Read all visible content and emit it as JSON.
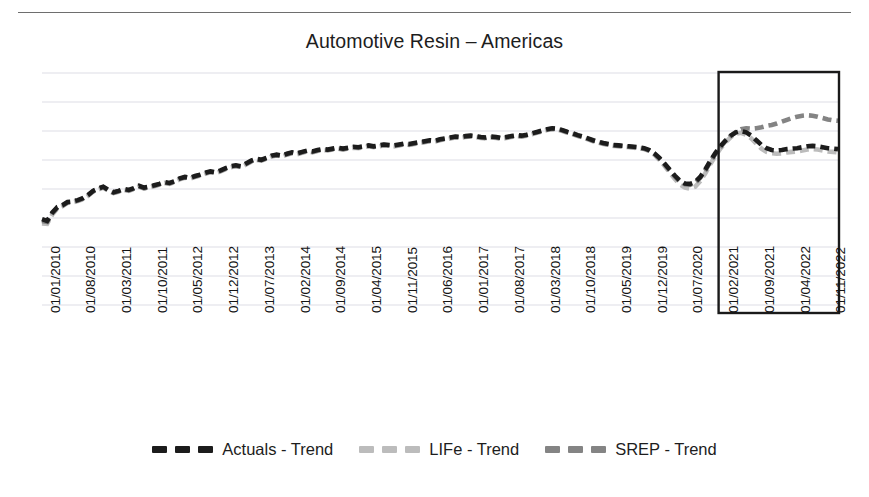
{
  "chart_data": {
    "type": "line",
    "title": "Automotive Resin – Americas",
    "xlabel": "",
    "ylabel": "",
    "grid": true,
    "gridlines": 9,
    "legend_position": "bottom",
    "ylim": [
      0,
      10
    ],
    "colors": {
      "actuals": "#1c1c1c",
      "life": "#bcbcbc",
      "srep": "#848484",
      "gridline": "#d9d9e2",
      "forecast_box": "#1a1a1a"
    },
    "annotations": [
      {
        "name": "forecast-region-box",
        "label": "",
        "start_x": "01/2021",
        "end_x": "01/2023",
        "description": "Rectangle outlining the forecast horizon"
      }
    ],
    "x_tick_labels": [
      "01/01/2010",
      "01/08/2010",
      "01/03/2011",
      "01/10/2011",
      "01/05/2012",
      "01/12/2012",
      "01/07/2013",
      "01/02/2014",
      "01/09/2014",
      "01/04/2015",
      "01/11/2015",
      "01/06/2016",
      "01/01/2017",
      "01/08/2017",
      "01/03/2018",
      "01/10/2018",
      "01/05/2019",
      "01/12/2019",
      "01/07/2020",
      "01/02/2021",
      "01/09/2021",
      "01/04/2022",
      "01/11/2022"
    ],
    "x_tick_indices": [
      0,
      7,
      14,
      21,
      28,
      35,
      42,
      49,
      56,
      63,
      70,
      77,
      84,
      91,
      98,
      105,
      112,
      119,
      126,
      133,
      140,
      147,
      154
    ],
    "n_points": 157,
    "forecast_start_index": 133,
    "series": [
      {
        "name": "Actuals - Trend",
        "key": "actuals",
        "color": "#1c1c1c",
        "dash": "9,5",
        "width": 4.6,
        "values": [
          3.7,
          3.62,
          3.98,
          4.22,
          4.3,
          4.44,
          4.46,
          4.52,
          4.6,
          4.74,
          4.92,
          5.02,
          5.1,
          4.96,
          4.86,
          4.92,
          5.0,
          4.96,
          5.04,
          5.14,
          5.06,
          5.1,
          5.16,
          5.22,
          5.3,
          5.26,
          5.34,
          5.46,
          5.52,
          5.48,
          5.56,
          5.62,
          5.7,
          5.76,
          5.72,
          5.8,
          5.9,
          5.98,
          6.02,
          5.98,
          6.1,
          6.22,
          6.3,
          6.26,
          6.34,
          6.44,
          6.48,
          6.44,
          6.52,
          6.58,
          6.54,
          6.6,
          6.66,
          6.62,
          6.68,
          6.72,
          6.7,
          6.74,
          6.78,
          6.74,
          6.78,
          6.82,
          6.8,
          6.84,
          6.88,
          6.84,
          6.88,
          6.92,
          6.9,
          6.88,
          6.92,
          6.96,
          6.94,
          6.98,
          7.02,
          7.06,
          7.1,
          7.08,
          7.14,
          7.18,
          7.22,
          7.26,
          7.24,
          7.28,
          7.3,
          7.28,
          7.24,
          7.22,
          7.26,
          7.24,
          7.2,
          7.24,
          7.28,
          7.32,
          7.3,
          7.34,
          7.4,
          7.46,
          7.52,
          7.58,
          7.62,
          7.6,
          7.54,
          7.46,
          7.4,
          7.32,
          7.26,
          7.18,
          7.1,
          7.04,
          6.98,
          6.94,
          6.9,
          6.88,
          6.86,
          6.84,
          6.82,
          6.8,
          6.76,
          6.68,
          6.54,
          6.34,
          6.1,
          5.84,
          5.58,
          5.36,
          5.24,
          5.22,
          5.3,
          5.52,
          5.84,
          6.22,
          6.56,
          6.86,
          7.1,
          7.3,
          7.44,
          7.5,
          7.44,
          7.3,
          7.1,
          6.9,
          6.76,
          6.68,
          6.66,
          6.68,
          6.72,
          6.74,
          6.76,
          6.8,
          6.84,
          6.86,
          6.84,
          6.8,
          6.76,
          6.74,
          6.72
        ]
      },
      {
        "name": "LIFe - Trend",
        "key": "life",
        "color": "#bcbcbc",
        "dash": "9,5",
        "width": 4.6,
        "values": [
          3.52,
          3.5,
          3.9,
          4.16,
          4.26,
          4.4,
          4.42,
          4.48,
          4.56,
          4.7,
          4.88,
          4.98,
          5.06,
          4.92,
          4.82,
          4.88,
          4.96,
          4.92,
          5.0,
          5.1,
          5.02,
          5.06,
          5.12,
          5.18,
          5.26,
          5.22,
          5.3,
          5.42,
          5.48,
          5.44,
          5.52,
          5.58,
          5.66,
          5.72,
          5.68,
          5.76,
          5.86,
          5.94,
          5.98,
          5.94,
          6.06,
          6.18,
          6.26,
          6.22,
          6.3,
          6.4,
          6.44,
          6.4,
          6.48,
          6.54,
          6.5,
          6.56,
          6.62,
          6.58,
          6.64,
          6.68,
          6.66,
          6.7,
          6.74,
          6.7,
          6.74,
          6.78,
          6.76,
          6.8,
          6.84,
          6.8,
          6.84,
          6.88,
          6.86,
          6.84,
          6.88,
          6.92,
          6.9,
          6.94,
          6.98,
          7.02,
          7.06,
          7.04,
          7.1,
          7.14,
          7.18,
          7.22,
          7.2,
          7.24,
          7.26,
          7.24,
          7.2,
          7.18,
          7.22,
          7.2,
          7.16,
          7.2,
          7.24,
          7.28,
          7.26,
          7.3,
          7.36,
          7.42,
          7.48,
          7.54,
          7.58,
          7.56,
          7.5,
          7.42,
          7.36,
          7.28,
          7.22,
          7.14,
          7.06,
          7.0,
          6.94,
          6.9,
          6.86,
          6.84,
          6.82,
          6.8,
          6.78,
          6.76,
          6.72,
          6.64,
          6.48,
          6.26,
          6.0,
          5.72,
          5.44,
          5.2,
          5.06,
          5.02,
          5.1,
          5.34,
          5.68,
          6.08,
          6.44,
          6.76,
          7.02,
          7.24,
          7.38,
          7.42,
          7.34,
          7.18,
          6.96,
          6.74,
          6.6,
          6.54,
          6.52,
          6.54,
          6.58,
          6.6,
          6.62,
          6.66,
          6.7,
          6.72,
          6.7,
          6.66,
          6.62,
          6.6,
          6.58
        ]
      },
      {
        "name": "SREP - Trend",
        "key": "srep",
        "color": "#848484",
        "dash": "9,5",
        "width": 4.6,
        "values": [
          3.62,
          3.58,
          3.94,
          4.2,
          4.28,
          4.42,
          4.44,
          4.5,
          4.58,
          4.72,
          4.9,
          5.0,
          5.08,
          4.94,
          4.84,
          4.9,
          4.98,
          4.94,
          5.02,
          5.12,
          5.04,
          5.08,
          5.14,
          5.2,
          5.28,
          5.24,
          5.32,
          5.44,
          5.5,
          5.46,
          5.54,
          5.6,
          5.68,
          5.74,
          5.7,
          5.78,
          5.88,
          5.96,
          6.0,
          5.96,
          6.08,
          6.2,
          6.28,
          6.24,
          6.32,
          6.42,
          6.46,
          6.42,
          6.5,
          6.56,
          6.52,
          6.58,
          6.64,
          6.6,
          6.66,
          6.7,
          6.68,
          6.72,
          6.76,
          6.72,
          6.76,
          6.8,
          6.78,
          6.82,
          6.86,
          6.82,
          6.86,
          6.9,
          6.88,
          6.86,
          6.9,
          6.94,
          6.92,
          6.96,
          7.0,
          7.04,
          7.08,
          7.06,
          7.12,
          7.16,
          7.2,
          7.24,
          7.22,
          7.26,
          7.28,
          7.26,
          7.22,
          7.2,
          7.24,
          7.22,
          7.18,
          7.22,
          7.26,
          7.3,
          7.28,
          7.32,
          7.38,
          7.44,
          7.5,
          7.56,
          7.6,
          7.58,
          7.52,
          7.44,
          7.38,
          7.3,
          7.24,
          7.16,
          7.08,
          7.02,
          6.96,
          6.92,
          6.88,
          6.86,
          6.84,
          6.82,
          6.8,
          6.78,
          6.74,
          6.66,
          6.52,
          6.3,
          6.06,
          5.8,
          5.54,
          5.32,
          5.2,
          5.18,
          5.26,
          5.48,
          5.8,
          6.18,
          6.52,
          6.82,
          7.08,
          7.3,
          7.46,
          7.58,
          7.62,
          7.6,
          7.62,
          7.66,
          7.72,
          7.76,
          7.82,
          7.9,
          7.98,
          8.06,
          8.12,
          8.16,
          8.18,
          8.16,
          8.12,
          8.06,
          8.0,
          7.96,
          7.94
        ]
      }
    ]
  },
  "legend": {
    "items": [
      {
        "label": "Actuals - Trend",
        "color": "#1c1c1c",
        "key": "actuals"
      },
      {
        "label": "LIFe - Trend",
        "color": "#bcbcbc",
        "key": "life"
      },
      {
        "label": "SREP - Trend",
        "color": "#848484",
        "key": "srep"
      }
    ]
  }
}
